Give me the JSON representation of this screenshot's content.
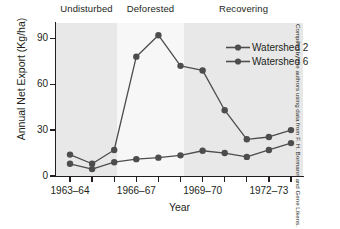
{
  "chart_data": {
    "type": "line",
    "title": "",
    "xlabel": "Year",
    "ylabel": "Annual Net Export (Kg/ha)",
    "ylim": [
      0,
      100
    ],
    "yticks": [
      0,
      30,
      60,
      90
    ],
    "ytick_labels": [
      "0",
      "30",
      "60",
      "90"
    ],
    "categories": [
      "1963–64",
      "1964–65",
      "1965–66",
      "1966–67",
      "1967–68",
      "1968–69",
      "1969–70",
      "1970–71",
      "1971–72",
      "1972–73",
      "1973–74"
    ],
    "xtick_labels": [
      "1963–64",
      "",
      "",
      "1966–67",
      "",
      "",
      "1969–70",
      "",
      "",
      "1972–73",
      ""
    ],
    "grid": false,
    "legend_position": "top-right",
    "series": [
      {
        "name": "Watershed 2",
        "color": "#4d4d4d",
        "values": [
          14,
          8,
          17,
          78,
          92,
          72,
          69,
          43,
          24,
          25.5,
          30
        ]
      },
      {
        "name": "Watershed 6",
        "color": "#4d4d4d",
        "values": [
          8,
          4.5,
          9,
          11,
          12,
          13.5,
          16.5,
          15,
          12.5,
          17,
          21.5
        ]
      }
    ],
    "bands": [
      {
        "label": "Undisturbed",
        "start_index": 0,
        "end_index": 2.75,
        "color": "#e8e8e8"
      },
      {
        "label": "Deforested",
        "start_index": 2.75,
        "end_index": 5.8,
        "color": "#f7f7f7"
      },
      {
        "label": "Recovering",
        "start_index": 5.8,
        "end_index": 11.2,
        "color": "#e8e8e8"
      }
    ]
  },
  "legend": {
    "items": [
      {
        "label": "Watershed 2"
      },
      {
        "label": "Watershed 6"
      }
    ]
  },
  "credit": {
    "text": "Compiled by the authors using data from F. H. Bormann and Gene Likens."
  }
}
